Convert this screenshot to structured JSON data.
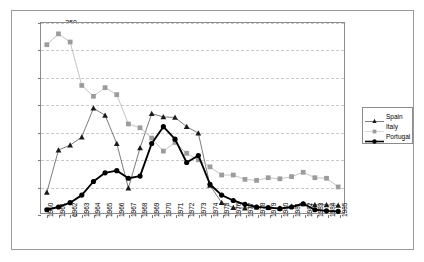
{
  "chart_data": {
    "type": "line",
    "title": "",
    "xlabel": "",
    "ylabel": "",
    "ylim": [
      0,
      350
    ],
    "ytick_step": 50,
    "yticks": [
      "0",
      "50",
      "100",
      "150",
      "200",
      "250",
      "300",
      "350"
    ],
    "grid": true,
    "grid_style": "dashed-horizontal",
    "legend_position": "right-outside",
    "categories": [
      "1960",
      "1961",
      "1962",
      "1963",
      "1964",
      "1965",
      "1966",
      "1967",
      "1968",
      "1969",
      "1970",
      "1971",
      "1972",
      "1973",
      "1974",
      "1975",
      "1976",
      "1977",
      "1978",
      "1979",
      "1980",
      "1981",
      "1982",
      "1983",
      "1984",
      "1985"
    ],
    "series": [
      {
        "name": "Spain",
        "marker": "triangle",
        "color": "#1a1a1a",
        "line_color": "#5a5a5a",
        "values": [
          38,
          116,
          125,
          140,
          193,
          180,
          128,
          46,
          120,
          183,
          177,
          176,
          159,
          147,
          51,
          19,
          10,
          9,
          11,
          10,
          9,
          12,
          17,
          15,
          15,
          14
        ]
      },
      {
        "name": "Italy",
        "marker": "square",
        "color": "#9c9c9c",
        "line_color": "#b5b5b5",
        "values": [
          310,
          330,
          315,
          235,
          215,
          231,
          218,
          164,
          157,
          138,
          114,
          130,
          110,
          98,
          85,
          70,
          70,
          62,
          60,
          65,
          63,
          67,
          75,
          65,
          64,
          48
        ]
      },
      {
        "name": "Portugal",
        "marker": "circle",
        "color": "#000000",
        "line_color": "#000000",
        "values": [
          6,
          11,
          19,
          33,
          58,
          74,
          78,
          64,
          68,
          128,
          159,
          136,
          93,
          106,
          53,
          33,
          23,
          16,
          11,
          10,
          8,
          11,
          17,
          6,
          4,
          3
        ]
      }
    ]
  },
  "legend": {
    "items": [
      {
        "label": "Spain"
      },
      {
        "label": "Italy"
      },
      {
        "label": "Portugal"
      }
    ]
  }
}
